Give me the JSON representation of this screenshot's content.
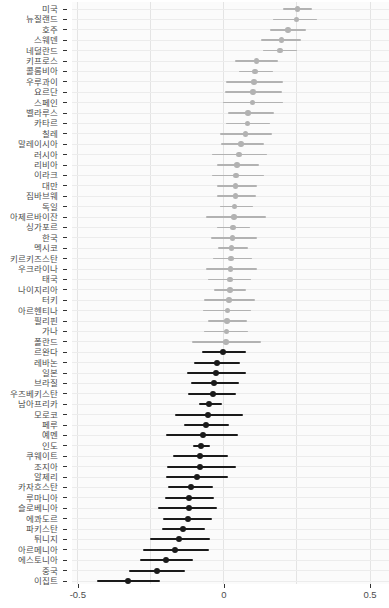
{
  "chart_data": {
    "type": "scatter",
    "subtype": "forest-dotplot-with-error-bars",
    "title": "",
    "xlabel": "",
    "ylabel": "",
    "grid": true,
    "legend": "none",
    "xlim": [
      -0.52,
      0.565
    ],
    "x_ticks": [
      -0.5,
      0,
      0.5
    ],
    "x_tick_labels": [
      "-0.5",
      "0",
      "0.5"
    ],
    "x_minor_gridlines": [
      -0.5,
      -0.25,
      0,
      0.25,
      0.5
    ],
    "colors": {
      "positive_group": "#b2b2b2",
      "negative_group": "#1a1a1a",
      "axis_text": "#4d4d4d"
    },
    "rows": [
      {
        "label": "미국",
        "est": 0.252,
        "lo": 0.201,
        "hi": 0.301,
        "group": "pos"
      },
      {
        "label": "뉴질랜드",
        "est": 0.248,
        "lo": 0.169,
        "hi": 0.317,
        "group": "pos"
      },
      {
        "label": "호주",
        "est": 0.219,
        "lo": 0.157,
        "hi": 0.28,
        "group": "pos"
      },
      {
        "label": "스웨덴",
        "est": 0.197,
        "lo": 0.128,
        "hi": 0.264,
        "group": "pos"
      },
      {
        "label": "네덜란드",
        "est": 0.192,
        "lo": 0.135,
        "hi": 0.251,
        "group": "pos"
      },
      {
        "label": "키프로스",
        "est": 0.111,
        "lo": 0.037,
        "hi": 0.186,
        "group": "pos"
      },
      {
        "label": "콜롬비아",
        "est": 0.107,
        "lo": 0.05,
        "hi": 0.169,
        "group": "pos"
      },
      {
        "label": "우루과이",
        "est": 0.103,
        "lo": 0.006,
        "hi": 0.201,
        "group": "pos"
      },
      {
        "label": "요르단",
        "est": 0.1,
        "lo": 0.005,
        "hi": 0.2,
        "group": "pos"
      },
      {
        "label": "스페인",
        "est": 0.098,
        "lo": -0.002,
        "hi": 0.203,
        "group": "pos"
      },
      {
        "label": "벨라루스",
        "est": 0.082,
        "lo": 0.015,
        "hi": 0.172,
        "group": "pos"
      },
      {
        "label": "카타르",
        "est": 0.08,
        "lo": 0.006,
        "hi": 0.158,
        "group": "pos"
      },
      {
        "label": "칠레",
        "est": 0.073,
        "lo": -0.014,
        "hi": 0.163,
        "group": "pos"
      },
      {
        "label": "말레이시아",
        "est": 0.058,
        "lo": -0.01,
        "hi": 0.138,
        "group": "pos"
      },
      {
        "label": "러시아",
        "est": 0.051,
        "lo": -0.04,
        "hi": 0.146,
        "group": "pos"
      },
      {
        "label": "리비아",
        "est": 0.044,
        "lo": -0.023,
        "hi": 0.12,
        "group": "pos"
      },
      {
        "label": "이라크",
        "est": 0.042,
        "lo": -0.042,
        "hi": 0.137,
        "group": "pos"
      },
      {
        "label": "대만",
        "est": 0.04,
        "lo": -0.025,
        "hi": 0.112,
        "group": "pos"
      },
      {
        "label": "짐바브웨",
        "est": 0.039,
        "lo": -0.025,
        "hi": 0.11,
        "group": "pos"
      },
      {
        "label": "독일",
        "est": 0.036,
        "lo": -0.014,
        "hi": 0.098,
        "group": "pos"
      },
      {
        "label": "아제르바이잔",
        "est": 0.035,
        "lo": -0.063,
        "hi": 0.143,
        "group": "pos"
      },
      {
        "label": "싱가포르",
        "est": 0.031,
        "lo": -0.023,
        "hi": 0.089,
        "group": "pos"
      },
      {
        "label": "한국",
        "est": 0.03,
        "lo": -0.045,
        "hi": 0.114,
        "group": "pos"
      },
      {
        "label": "멕시코",
        "est": 0.026,
        "lo": -0.02,
        "hi": 0.083,
        "group": "pos"
      },
      {
        "label": "키르키즈스탄",
        "est": 0.024,
        "lo": -0.039,
        "hi": 0.097,
        "group": "pos"
      },
      {
        "label": "우크라이나",
        "est": 0.022,
        "lo": -0.063,
        "hi": 0.112,
        "group": "pos"
      },
      {
        "label": "태국",
        "est": 0.021,
        "lo": -0.056,
        "hi": 0.092,
        "group": "pos"
      },
      {
        "label": "나이지리아",
        "est": 0.02,
        "lo": -0.034,
        "hi": 0.075,
        "group": "pos"
      },
      {
        "label": "터키",
        "est": 0.018,
        "lo": -0.068,
        "hi": 0.106,
        "group": "pos"
      },
      {
        "label": "아르헨티나",
        "est": 0.013,
        "lo": -0.073,
        "hi": 0.091,
        "group": "pos"
      },
      {
        "label": "필리핀",
        "est": 0.01,
        "lo": -0.056,
        "hi": 0.078,
        "group": "pos"
      },
      {
        "label": "가나",
        "est": 0.008,
        "lo": -0.068,
        "hi": 0.083,
        "group": "pos"
      },
      {
        "label": "폴란드",
        "est": 0.007,
        "lo": -0.108,
        "hi": 0.127,
        "group": "pos"
      },
      {
        "label": "르완다",
        "est": -0.003,
        "lo": -0.076,
        "hi": 0.074,
        "group": "neg"
      },
      {
        "label": "레바논",
        "est": -0.024,
        "lo": -0.103,
        "hi": 0.055,
        "group": "neg"
      },
      {
        "label": "일본",
        "est": -0.026,
        "lo": -0.128,
        "hi": 0.075,
        "group": "neg"
      },
      {
        "label": "브라질",
        "est": -0.033,
        "lo": -0.114,
        "hi": 0.052,
        "group": "neg"
      },
      {
        "label": "우즈베키스탄",
        "est": -0.039,
        "lo": -0.122,
        "hi": 0.043,
        "group": "neg"
      },
      {
        "label": "남아프리카",
        "est": -0.051,
        "lo": -0.085,
        "hi": -0.006,
        "group": "neg"
      },
      {
        "label": "모로코",
        "est": -0.055,
        "lo": -0.168,
        "hi": 0.066,
        "group": "neg"
      },
      {
        "label": "페루",
        "est": -0.063,
        "lo": -0.136,
        "hi": 0.018,
        "group": "neg"
      },
      {
        "label": "예멘",
        "est": -0.073,
        "lo": -0.199,
        "hi": 0.047,
        "group": "neg"
      },
      {
        "label": "인도",
        "est": -0.079,
        "lo": -0.105,
        "hi": -0.046,
        "group": "neg"
      },
      {
        "label": "쿠웨이트",
        "est": -0.081,
        "lo": -0.174,
        "hi": 0.015,
        "group": "neg"
      },
      {
        "label": "조지아",
        "est": -0.082,
        "lo": -0.196,
        "hi": 0.04,
        "group": "neg"
      },
      {
        "label": "알제리",
        "est": -0.092,
        "lo": -0.199,
        "hi": 0.015,
        "group": "neg"
      },
      {
        "label": "카자흐스탄",
        "est": -0.114,
        "lo": -0.191,
        "hi": -0.039,
        "group": "neg"
      },
      {
        "label": "루마니아",
        "est": -0.119,
        "lo": -0.2,
        "hi": -0.034,
        "group": "neg"
      },
      {
        "label": "슬로베니아",
        "est": -0.121,
        "lo": -0.225,
        "hi": -0.023,
        "group": "neg"
      },
      {
        "label": "에콰도르",
        "est": -0.124,
        "lo": -0.208,
        "hi": -0.042,
        "group": "neg"
      },
      {
        "label": "파키스탄",
        "est": -0.141,
        "lo": -0.213,
        "hi": -0.065,
        "group": "neg"
      },
      {
        "label": "튀니지",
        "est": -0.153,
        "lo": -0.253,
        "hi": -0.046,
        "group": "neg"
      },
      {
        "label": "아르메니아",
        "est": -0.168,
        "lo": -0.276,
        "hi": -0.051,
        "group": "neg"
      },
      {
        "label": "에스토니아",
        "est": -0.199,
        "lo": -0.288,
        "hi": -0.107,
        "group": "neg"
      },
      {
        "label": "중국",
        "est": -0.228,
        "lo": -0.324,
        "hi": -0.134,
        "group": "neg"
      },
      {
        "label": "이집트",
        "est": -0.328,
        "lo": -0.436,
        "hi": -0.219,
        "group": "neg"
      }
    ]
  }
}
